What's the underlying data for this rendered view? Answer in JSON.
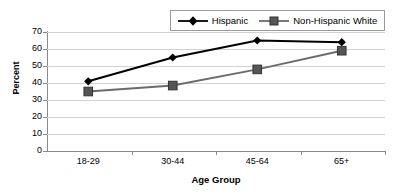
{
  "chart_data": {
    "type": "line",
    "title": "",
    "xlabel": "Age Group",
    "ylabel": "Percent",
    "categories": [
      "18-29",
      "30-44",
      "45-64",
      "65+"
    ],
    "ylim": [
      0,
      70
    ],
    "ytick_step": 10,
    "yticks": [
      "70",
      "60",
      "50",
      "40",
      "30",
      "20",
      "10",
      "0"
    ],
    "grid": true,
    "legend_position": "top",
    "series": [
      {
        "name": "Hispanic",
        "values": [
          41,
          55,
          65,
          64
        ],
        "color": "#000000",
        "marker": "diamond"
      },
      {
        "name": "Non-Hispanic White",
        "values": [
          35,
          38.5,
          48,
          59
        ],
        "color": "#6b6b6b",
        "marker": "square"
      }
    ]
  },
  "legend": {
    "items": [
      {
        "label": "Hispanic",
        "marker": "diamond-marker-icon"
      },
      {
        "label": "Non-Hispanic White",
        "marker": "square-marker-icon"
      }
    ]
  },
  "colors": {
    "hispanic_line": "#000000",
    "nhwhite_line": "#6b6b6b",
    "gridline": "#d2d2d2",
    "axis": "#8a8a8a",
    "background": "#ffffff"
  }
}
